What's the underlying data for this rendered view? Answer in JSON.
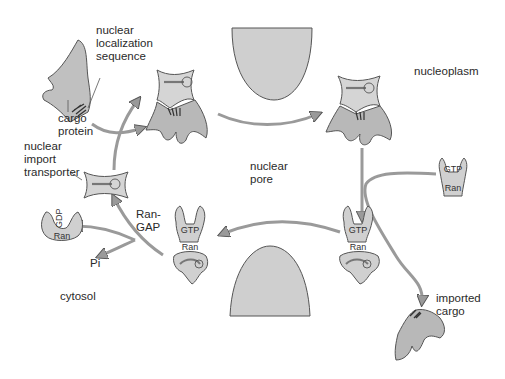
{
  "diagram": {
    "regions": {
      "nucleoplasm": "nucleoplasm",
      "cytosol": "cytosol",
      "nuclear_pore": "nuclear\npore"
    },
    "labels": {
      "nls": "nuclear\nlocalization\nsequence",
      "cargo_protein": "cargo\nprotein",
      "import_transporter": "nuclear\nimport\ntransporter",
      "ran_gap": "Ran-\nGAP",
      "pi": "Pi",
      "imported_cargo": "imported\ncargo"
    },
    "molecule_labels": {
      "gtp": "GTP",
      "gdp": "GDP",
      "ran": "Ran"
    },
    "colors": {
      "fill": "#c8c8c8",
      "stroke": "#555555",
      "pore": "#cfcfcf",
      "nls_mark": "#3a3a3a",
      "background": "#ffffff"
    }
  }
}
